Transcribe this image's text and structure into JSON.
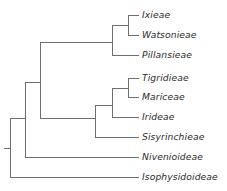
{
  "figure": {
    "type": "cladogram",
    "orientation": "left-to-right",
    "line_color": "#6e6e6e",
    "line_width": 1,
    "text_color": "#2b2b2b",
    "background": "#ffffff",
    "width": 227,
    "height": 191
  },
  "taxa": [
    {
      "label": "Ixieae",
      "x": 142,
      "y": 15,
      "tip_x": 128
    },
    {
      "label": "Watsonieae",
      "x": 142,
      "y": 35,
      "tip_x": 128
    },
    {
      "label": "Pillansieae",
      "x": 142,
      "y": 55,
      "tip_x": 112
    },
    {
      "label": "Tigridieae",
      "x": 142,
      "y": 78,
      "tip_x": 128
    },
    {
      "label": "Mariceae",
      "x": 142,
      "y": 97,
      "tip_x": 128
    },
    {
      "label": "Irideae",
      "x": 142,
      "y": 117,
      "tip_x": 112
    },
    {
      "label": "Sisyrinchieae",
      "x": 142,
      "y": 137,
      "tip_x": 95
    },
    {
      "label": "Nivenioideae",
      "x": 142,
      "y": 157,
      "tip_x": 25
    },
    {
      "label": "Isophysidoideae",
      "x": 142,
      "y": 177,
      "tip_x": 10
    }
  ],
  "nodes": [
    {
      "name": "root",
      "x": 10,
      "y_top": 118,
      "y_bottom": 177,
      "stem_from_x": 4,
      "stem_y": 148
    },
    {
      "name": "crown-iridaceae",
      "x": 25,
      "y_top": 82,
      "y_bottom": 157,
      "stem_from_x": 10,
      "stem_y": 118
    },
    {
      "name": "node-c",
      "x": 40,
      "y_top": 42,
      "y_bottom": 118,
      "stem_from_x": 25,
      "stem_y": 82
    },
    {
      "name": "crocoideae-clade",
      "x": 112,
      "y_top": 25,
      "y_bottom": 55,
      "stem_from_x": 40,
      "stem_y": 42
    },
    {
      "name": "ixieae-watsonieae",
      "x": 128,
      "y_top": 15,
      "y_bottom": 35,
      "stem_from_x": 112,
      "stem_y": 25
    },
    {
      "name": "iridoideae-clade",
      "x": 95,
      "y_top": 105,
      "y_bottom": 137,
      "stem_from_x": 40,
      "stem_y": 118
    },
    {
      "name": "node-f",
      "x": 112,
      "y_top": 88,
      "y_bottom": 117,
      "stem_from_x": 95,
      "stem_y": 105
    },
    {
      "name": "tigridieae-mariceae",
      "x": 128,
      "y_top": 78,
      "y_bottom": 97,
      "stem_from_x": 112,
      "stem_y": 88
    }
  ]
}
